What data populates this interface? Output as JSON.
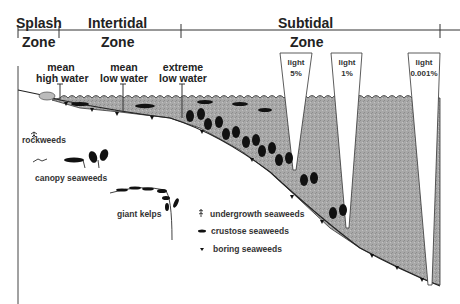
{
  "zones": {
    "splash": {
      "line1": "Splash",
      "line2": "Zone"
    },
    "intertidal": {
      "line1": "Intertidal",
      "line2": "Zone"
    },
    "subtidal": {
      "line1": "Subtidal",
      "line2": "Zone"
    }
  },
  "water_levels": [
    {
      "line1": "mean",
      "line2": "high water"
    },
    {
      "line1": "mean",
      "line2": "low water"
    },
    {
      "line1": "extreme",
      "line2": "low water"
    }
  ],
  "light_levels": [
    {
      "line1": "light",
      "line2": "5%"
    },
    {
      "line1": "light",
      "line2": "1%"
    },
    {
      "line1": "light",
      "line2": "0.001%"
    }
  ],
  "legend": {
    "rockweeds": "rockweeds",
    "canopy": "canopy seaweeds",
    "kelps": "giant kelps",
    "undergrowth": "undergrowth seaweeds",
    "crustose": "crustose seaweeds",
    "boring": "boring seaweeds"
  },
  "colors": {
    "water": "#a9a9a9",
    "ink": "#1a1a1a",
    "background": "#ffffff"
  }
}
